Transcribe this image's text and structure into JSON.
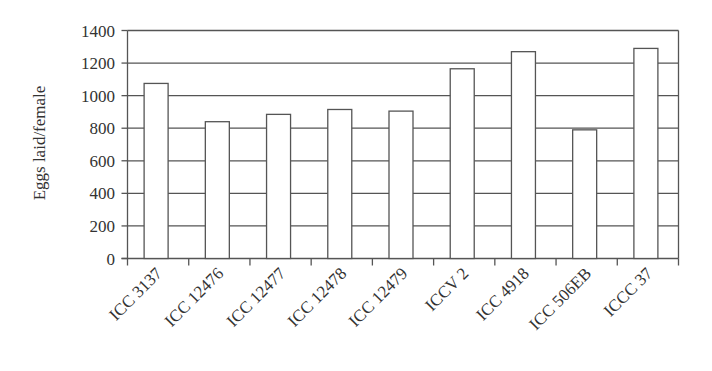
{
  "chart_data": {
    "type": "bar",
    "title": "",
    "xlabel": "",
    "ylabel": "Eggs laid/female",
    "ylim": [
      0,
      1400
    ],
    "yticks": [
      0,
      200,
      400,
      600,
      800,
      1000,
      1200,
      1400
    ],
    "ytick_labels": [
      "0",
      "200",
      "400",
      "600",
      "800",
      "1000",
      "1200",
      "1400"
    ],
    "grid": true,
    "legend": null,
    "categories": [
      "ICC 3137",
      "ICC 12476",
      "ICC 12477",
      "ICC 12478",
      "ICC 12479",
      "ICCV 2",
      "ICC 4918",
      "ICC 506EB",
      "ICCC 37"
    ],
    "values": [
      1075,
      840,
      885,
      915,
      905,
      1165,
      1270,
      790,
      1290
    ],
    "bar_fill": "#ffffff",
    "bar_stroke": "#555555",
    "grid_color": "#555555"
  }
}
